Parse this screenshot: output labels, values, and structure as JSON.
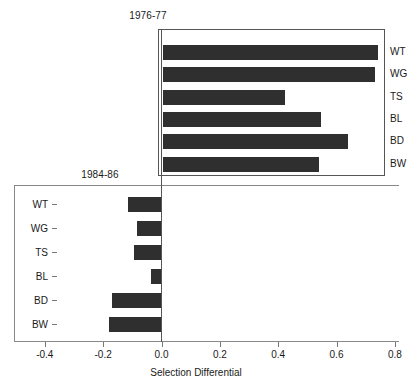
{
  "chart_data": {
    "type": "bar",
    "orientation": "horizontal",
    "title": "",
    "xlabel": "Selection Differential",
    "ylabel": "",
    "xlim": [
      -0.4,
      0.8
    ],
    "xticks": [
      -0.4,
      -0.2,
      0.0,
      0.2,
      0.4,
      0.6,
      0.8
    ],
    "xtick_labels": [
      "-0.4",
      "-0.2",
      "0.0",
      "0.2",
      "0.4",
      "0.6",
      "0.8"
    ],
    "grid": false,
    "legend": "none",
    "bar_color": "#2f2f2f",
    "panels": [
      {
        "name": "upper",
        "title": "1976-77",
        "label_side": "right",
        "categories": [
          "WT",
          "WG",
          "TS",
          "BL",
          "BD",
          "BW"
        ],
        "values": [
          0.74,
          0.73,
          0.42,
          0.545,
          0.635,
          0.535
        ]
      },
      {
        "name": "lower",
        "title": "1984-86",
        "label_side": "left",
        "categories": [
          "WT",
          "WG",
          "TS",
          "BL",
          "BD",
          "BW"
        ],
        "values": [
          -0.115,
          -0.085,
          -0.095,
          -0.035,
          -0.17,
          -0.18
        ]
      }
    ]
  },
  "upper_panel": {
    "title": "1976-77",
    "labels": [
      "WT",
      "WG",
      "TS",
      "BL",
      "BD",
      "BW"
    ]
  },
  "lower_panel": {
    "title": "1984-86",
    "labels": [
      "WT",
      "WG",
      "TS",
      "BL",
      "BD",
      "BW"
    ]
  },
  "axis": {
    "xlabel": "Selection Differential",
    "ticks": [
      "-0.4",
      "-0.2",
      "0.0",
      "0.2",
      "0.4",
      "0.6",
      "0.8"
    ]
  }
}
